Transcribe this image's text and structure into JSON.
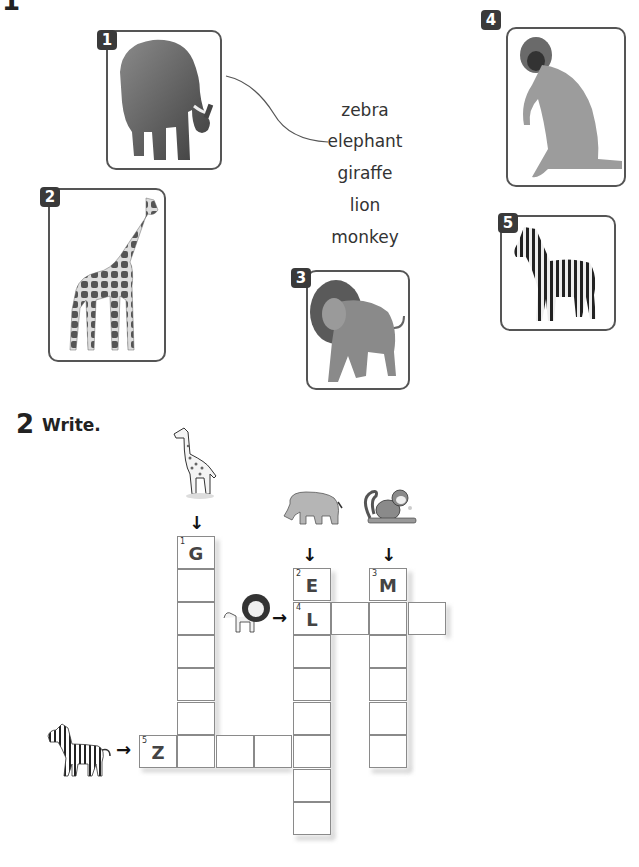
{
  "section1": {
    "number_partial": "1",
    "words": [
      "zebra",
      "elephant",
      "giraffe",
      "lion",
      "monkey"
    ],
    "cards": [
      {
        "badge": "1",
        "animal": "elephant"
      },
      {
        "badge": "2",
        "animal": "giraffe"
      },
      {
        "badge": "3",
        "animal": "lion"
      },
      {
        "badge": "4",
        "animal": "monkey"
      },
      {
        "badge": "5",
        "animal": "zebra"
      }
    ],
    "example_match": {
      "from_card": "1",
      "to_word": "elephant"
    }
  },
  "section2": {
    "number": "2",
    "title": "Write.",
    "crossword": {
      "clues": [
        {
          "number": "1",
          "direction": "down",
          "given_letter": "G",
          "length": 7,
          "picture": "giraffe"
        },
        {
          "number": "2",
          "direction": "down",
          "given_letter": "E",
          "length": 8,
          "picture": "elephant"
        },
        {
          "number": "3",
          "direction": "down",
          "given_letter": "M",
          "length": 6,
          "picture": "monkey"
        },
        {
          "number": "4",
          "direction": "across",
          "given_letter": "L",
          "length": 4,
          "picture": "lion"
        },
        {
          "number": "5",
          "direction": "across",
          "given_letter": "Z",
          "length": 5,
          "picture": "zebra"
        }
      ]
    }
  }
}
